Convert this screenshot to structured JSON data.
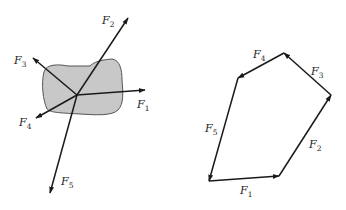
{
  "diagram": {
    "left_panel": {
      "description": "Rigid body acted on by five concurrent forces",
      "origin": [
        77,
        95
      ],
      "forces": [
        {
          "name": "F",
          "sub": "1",
          "tip": [
            145,
            90
          ],
          "label_pos": [
            137,
            108
          ]
        },
        {
          "name": "F",
          "sub": "2",
          "tip": [
            128,
            18
          ],
          "label_pos": [
            102,
            24
          ]
        },
        {
          "name": "F",
          "sub": "3",
          "tip": [
            33,
            58
          ],
          "label_pos": [
            14,
            64
          ]
        },
        {
          "name": "F",
          "sub": "4",
          "tip": [
            36,
            118
          ],
          "label_pos": [
            19,
            126
          ]
        },
        {
          "name": "F",
          "sub": "5",
          "tip": [
            50,
            193
          ],
          "label_pos": [
            61,
            185
          ]
        }
      ]
    },
    "right_panel": {
      "description": "Force polygon (head-to-tail)",
      "vertices": [
        [
          209,
          181
        ],
        [
          279,
          176
        ],
        [
          331,
          95
        ],
        [
          284,
          53
        ],
        [
          238,
          78
        ]
      ],
      "edges": [
        {
          "name": "F",
          "sub": "1",
          "from": 0,
          "to": 1,
          "label_pos": [
            240,
            194
          ]
        },
        {
          "name": "F",
          "sub": "2",
          "from": 1,
          "to": 2,
          "label_pos": [
            309,
            148
          ]
        },
        {
          "name": "F",
          "sub": "3",
          "from": 2,
          "to": 3,
          "label_pos": [
            311,
            75
          ]
        },
        {
          "name": "F",
          "sub": "4",
          "from": 3,
          "to": 4,
          "label_pos": [
            253,
            58
          ]
        },
        {
          "name": "F",
          "sub": "5",
          "from": 4,
          "to": 0,
          "label_pos": [
            205,
            132
          ]
        }
      ]
    },
    "colors": {
      "stroke": "#1a1a1a",
      "body_fill": "#c8c8c8",
      "body_outline": "#555555"
    }
  }
}
